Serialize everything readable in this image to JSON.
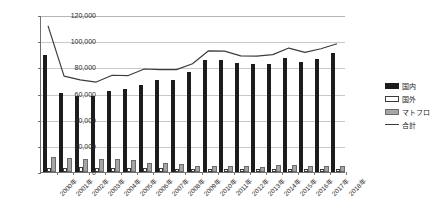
{
  "chart_data": {
    "type": "bar",
    "title": "",
    "xlabel": "",
    "ylabel": "",
    "ylim": [
      0,
      120000
    ],
    "ytick_step": 20000,
    "ytick_labels": [
      "0",
      "20,000",
      "40,000",
      "60,000",
      "80,000",
      "100,000",
      "120,000"
    ],
    "ytick_values": [
      0,
      20000,
      40000,
      60000,
      80000,
      100000,
      120000
    ],
    "grid": true,
    "legend_position": "right",
    "categories": [
      "2000年",
      "2001年",
      "2002年",
      "2003年",
      "2004年",
      "2005年",
      "2006年",
      "2007年",
      "2008年",
      "2009年",
      "2010年",
      "2011年",
      "2012年",
      "2013年",
      "2014年",
      "2015年",
      "2016年",
      "2017年",
      "2018年"
    ],
    "series": [
      {
        "name": "国内",
        "kind": "bar",
        "color": "#1c1c1c",
        "values": [
          89500,
          60500,
          58000,
          57800,
          62000,
          63800,
          66300,
          70500,
          70000,
          76500,
          85700,
          85800,
          83000,
          82800,
          82600,
          87300,
          84300,
          86500,
          91000
        ]
      },
      {
        "name": "国外",
        "kind": "bar",
        "color": "#ffffff",
        "values": [
          3200,
          3400,
          3600,
          3300,
          3400,
          3200,
          2900,
          2700,
          2600,
          2400,
          2200,
          2100,
          2100,
          2000,
          2300,
          2600,
          2200,
          2100,
          2100
        ]
      },
      {
        "name": "マトフロ",
        "kind": "bar",
        "color": "#a6a6a6",
        "values": [
          11800,
          11000,
          9700,
          9600,
          9600,
          9500,
          7200,
          6700,
          6500,
          4500,
          4500,
          4300,
          4400,
          3900,
          5000,
          5600,
          4600,
          4700,
          4700
        ]
      },
      {
        "name": "合計",
        "kind": "line",
        "color": "#3d3d3d",
        "values": [
          112500,
          74000,
          71200,
          69500,
          74700,
          74500,
          79500,
          79000,
          79000,
          83500,
          93400,
          93200,
          89500,
          89300,
          90500,
          95500,
          92200,
          95000,
          98800
        ]
      }
    ]
  },
  "legend": {
    "items": [
      {
        "label": "国内",
        "key": "k-domestic",
        "icon": "black-bar-swatch-icon"
      },
      {
        "label": "国外",
        "key": "k-overseas",
        "icon": "white-bar-swatch-icon"
      },
      {
        "label": "マトフロ",
        "key": "k-matofuro",
        "icon": "gray-bar-swatch-icon"
      },
      {
        "label": "合計",
        "key": "k-total",
        "icon": "line-swatch-icon"
      }
    ]
  }
}
